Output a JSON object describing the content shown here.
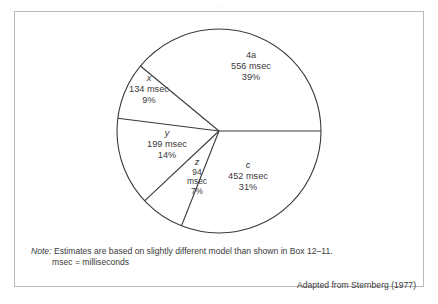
{
  "figure": {
    "top_crop_text": "· ·",
    "border_color": "#b9b9b9",
    "line_color": "#3a3a3a",
    "background": "#ffffff"
  },
  "chart_data": {
    "type": "pie",
    "title": "",
    "subtitle": "",
    "xlabel": "",
    "ylabel": "",
    "legend_position": "none",
    "grid": false,
    "units": "msec",
    "total_msec": 1435,
    "categories": [
      "4a",
      "c",
      "z",
      "y",
      "x"
    ],
    "values": [
      39,
      31,
      7,
      14,
      9
    ],
    "slices": [
      {
        "key": "4a",
        "key_italic": false,
        "value_msec": 556,
        "value_label": "556 msec",
        "percent": 39,
        "percent_label": "39%",
        "start_deg": 0,
        "end_deg": 140.4
      },
      {
        "key": "x",
        "key_italic": true,
        "value_msec": 134,
        "value_label": "134 msec",
        "percent": 9,
        "percent_label": "9%",
        "start_deg": 140.4,
        "end_deg": 172.8
      },
      {
        "key": "y",
        "key_italic": true,
        "value_msec": 199,
        "value_label": "199 msec",
        "percent": 14,
        "percent_label": "14%",
        "start_deg": 172.8,
        "end_deg": 223.2
      },
      {
        "key": "z",
        "key_italic": true,
        "value_msec": 94,
        "value_label": "94",
        "value_label_line2": "msec",
        "percent": 7,
        "percent_label": "7%",
        "start_deg": 223.2,
        "end_deg": 248.4
      },
      {
        "key": "c",
        "key_italic": true,
        "value_msec": 452,
        "value_label": "452 msec",
        "percent": 31,
        "percent_label": "31%",
        "start_deg": 248.4,
        "end_deg": 360
      }
    ]
  },
  "footnote": {
    "note_word": "Note:",
    "line1": " Estimates are based on slightly different model than shown in Box 12–11.",
    "line2": "msec  =  milliseconds"
  },
  "attribution": {
    "text": "Adapted from Sternberg (1977)"
  }
}
